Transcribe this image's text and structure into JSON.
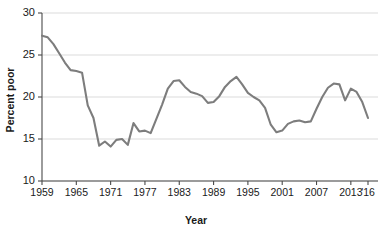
{
  "chart_data": {
    "type": "line",
    "title": "",
    "xlabel": "Year",
    "ylabel": "Percent poor",
    "xlim": [
      1959,
      2016
    ],
    "ylim": [
      10,
      30
    ],
    "ytick_values": [
      10,
      15,
      20,
      25,
      30
    ],
    "ytick_labels": [
      "10",
      "15",
      "20",
      "25",
      "30"
    ],
    "xtick_values": [
      1959,
      1965,
      1971,
      1977,
      1983,
      1989,
      1995,
      2001,
      2007,
      2013,
      2016
    ],
    "xtick_labels": [
      "1959",
      "1965",
      "1971",
      "1977",
      "1983",
      "1989",
      "1995",
      "2001",
      "2007",
      "2013",
      "'16"
    ],
    "grid": "horizontal",
    "legend": "none",
    "line_color": "#7d7d7d",
    "grid_color": "#d2d2d2",
    "axis_color": "#4a4a4a",
    "series": [
      {
        "name": "Percent poor",
        "x": [
          1959,
          1960,
          1961,
          1962,
          1963,
          1964,
          1965,
          1966,
          1967,
          1968,
          1969,
          1970,
          1971,
          1972,
          1973,
          1974,
          1975,
          1976,
          1977,
          1978,
          1979,
          1980,
          1981,
          1982,
          1983,
          1984,
          1985,
          1986,
          1987,
          1988,
          1989,
          1990,
          1991,
          1992,
          1993,
          1994,
          1995,
          1996,
          1997,
          1998,
          1999,
          2000,
          2001,
          2002,
          2003,
          2004,
          2005,
          2006,
          2007,
          2008,
          2009,
          2010,
          2011,
          2012,
          2013,
          2014,
          2015,
          2016
        ],
        "values": [
          27.3,
          27.1,
          26.3,
          25.2,
          24.1,
          23.2,
          23.1,
          22.9,
          19.0,
          17.5,
          14.2,
          14.7,
          14.1,
          14.9,
          15.0,
          14.3,
          16.9,
          15.9,
          16.0,
          15.7,
          17.4,
          19.1,
          21.0,
          21.9,
          22.0,
          21.2,
          20.6,
          20.4,
          20.1,
          19.3,
          19.4,
          20.1,
          21.2,
          21.9,
          22.4,
          21.5,
          20.5,
          20.0,
          19.6,
          18.7,
          16.7,
          15.8,
          16.0,
          16.8,
          17.1,
          17.2,
          17.0,
          17.1,
          18.6,
          20.0,
          21.1,
          21.6,
          21.5,
          19.6,
          21.0,
          20.6,
          19.4,
          17.5
        ]
      }
    ]
  }
}
